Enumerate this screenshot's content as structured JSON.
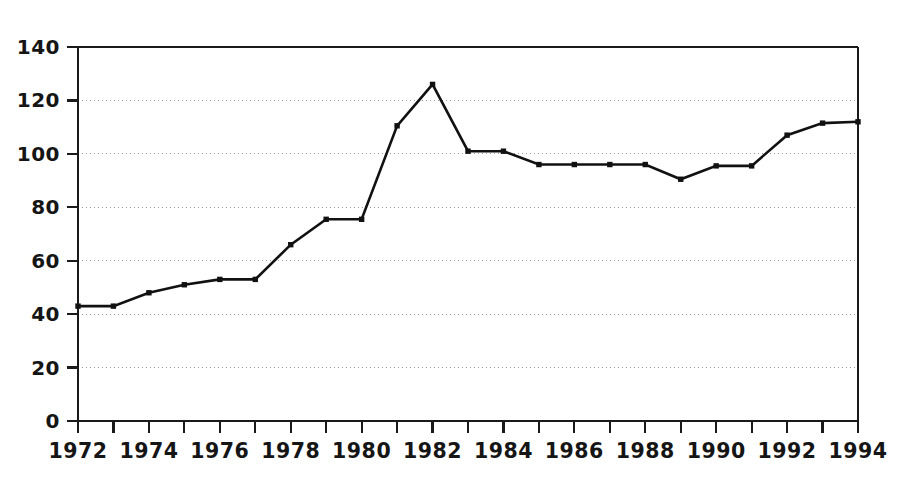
{
  "chart_data": {
    "type": "line",
    "title": "",
    "subtitle": "",
    "xlabel": "",
    "ylabel": "",
    "x": [
      1972,
      1973,
      1974,
      1975,
      1976,
      1977,
      1978,
      1979,
      1980,
      1981,
      1982,
      1983,
      1984,
      1985,
      1986,
      1987,
      1988,
      1989,
      1990,
      1991,
      1992,
      1993,
      1994
    ],
    "values": [
      43,
      43,
      48,
      51,
      53,
      53,
      66,
      75.5,
      75.5,
      110.5,
      126,
      101,
      101,
      96,
      96,
      96,
      96,
      90.5,
      95.5,
      95.5,
      107,
      111.5,
      112
    ],
    "series": [
      {
        "name": "series-1",
        "values": [
          43,
          43,
          48,
          51,
          53,
          53,
          66,
          75.5,
          75.5,
          110.5,
          126,
          101,
          101,
          96,
          96,
          96,
          96,
          90.5,
          95.5,
          95.5,
          107,
          111.5,
          112
        ]
      }
    ],
    "xlim": [
      1972,
      1994
    ],
    "ylim": [
      0,
      140
    ],
    "y_ticks": [
      0,
      20,
      40,
      60,
      80,
      100,
      120,
      140
    ],
    "y_tick_labels": [
      "0",
      "20",
      "40",
      "60",
      "80",
      "100",
      "120",
      "140"
    ],
    "x_ticks": [
      1972,
      1973,
      1974,
      1975,
      1976,
      1977,
      1978,
      1979,
      1980,
      1981,
      1982,
      1983,
      1984,
      1985,
      1986,
      1987,
      1988,
      1989,
      1990,
      1991,
      1992,
      1993,
      1994
    ],
    "x_tick_labels": [
      "1972",
      "",
      "1974",
      "",
      "1976",
      "",
      "1978",
      "",
      "1980",
      "",
      "1982",
      "",
      "1984",
      "",
      "1986",
      "",
      "1988",
      "",
      "1990",
      "",
      "1992",
      "",
      "1994"
    ],
    "x_major_labels": [
      "1972",
      "1974",
      "1976",
      "1978",
      "1980",
      "1982",
      "1984",
      "1986",
      "1988",
      "1990",
      "1992",
      "1994"
    ],
    "grid": "horizontal-dotted",
    "legend": null,
    "legend_position": "none",
    "marker": "square",
    "line_color": "#111111",
    "marker_color": "#111111",
    "grid_color": "#9a9a9a",
    "axis_color": "#1a1a1a",
    "background_color": "#ffffff",
    "annotations": []
  },
  "plot": {
    "left": 78,
    "right": 858,
    "top": 47,
    "bottom": 421
  }
}
